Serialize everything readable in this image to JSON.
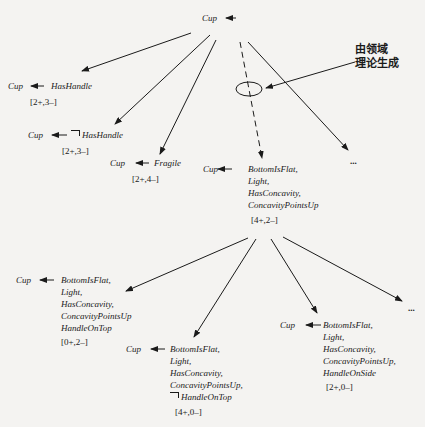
{
  "root": {
    "label": "Cup"
  },
  "annotation": {
    "line1": "由领域",
    "line2": "理论生成"
  },
  "level1": [
    {
      "head": "Cup",
      "body": "HasHandle",
      "negated": false,
      "counts": "[2+,3–]"
    },
    {
      "head": "Cup",
      "body": "HasHandle",
      "negated": true,
      "counts": "[2+,3–]"
    },
    {
      "head": "Cup",
      "body": "Fragile",
      "negated": false,
      "counts": "[2+,4–]"
    },
    {
      "head": "Cup",
      "body": [
        "BottomIsFlat,",
        "Light,",
        "HasConcavity,",
        "ConcavityPointsUp"
      ],
      "counts": "[4+,2–]"
    },
    {
      "ellipsis": "..."
    }
  ],
  "level2": [
    {
      "head": "Cup",
      "body": [
        "BottomIsFlat,",
        "Light,",
        "HasConcavity,",
        "ConcavityPointsUp",
        "HandleOnTop"
      ],
      "counts": "[0+,2–]"
    },
    {
      "head": "Cup",
      "body": [
        "BottomIsFlat,",
        "Light,",
        "HasConcavity,",
        "ConcavityPointsUp,",
        "HandleOnTop"
      ],
      "negated_last": true,
      "counts": "[4+,0–]"
    },
    {
      "head": "Cup",
      "body": [
        "BottomIsFlat,",
        "Light,",
        "HasConcavity,",
        "ConcavityPointsUp,",
        "HandleOnSide"
      ],
      "counts": "[2+,0–]"
    },
    {
      "ellipsis": "..."
    }
  ]
}
